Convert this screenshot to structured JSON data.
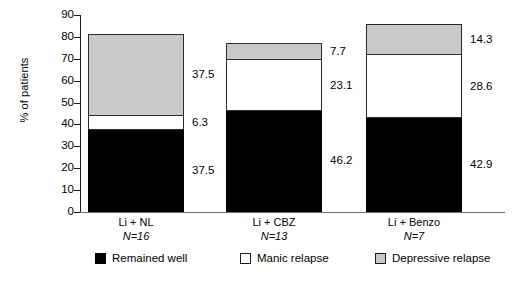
{
  "chart_data": {
    "type": "bar",
    "subtype": "stacked-bar",
    "title": "",
    "xlabel": "",
    "ylabel": "% of patients",
    "ylim": [
      0,
      90
    ],
    "ytick_step": 10,
    "yticks": [
      90,
      80,
      70,
      60,
      50,
      40,
      30,
      20,
      10,
      0
    ],
    "grid": false,
    "legend_position": "bottom",
    "categories": [
      "Li + NL",
      "Li + CBZ",
      "Li + Benzo"
    ],
    "category_sublabels": [
      "N=16",
      "N=13",
      "N=7"
    ],
    "series": [
      {
        "name": "Remained well",
        "color": "#000000",
        "values": [
          37.5,
          46.2,
          42.9
        ],
        "value_labels": [
          "37.5",
          "46.2",
          "42.9"
        ]
      },
      {
        "name": "Manic relapse",
        "color": "#ffffff",
        "values": [
          6.3,
          23.1,
          28.6
        ],
        "value_labels": [
          "6.3",
          "23.1",
          "28.6"
        ]
      },
      {
        "name": "Depressive relapse",
        "color": "#c9c9c9",
        "values": [
          37.5,
          7.7,
          14.3
        ],
        "value_labels": [
          "37.5",
          "7.7",
          "14.3"
        ]
      }
    ],
    "totals": [
      81.3,
      77.0,
      85.8
    ]
  },
  "axis": {
    "y_title": "% of patients",
    "y_tick_labels": [
      "90",
      "80",
      "70",
      "60",
      "50",
      "40",
      "30",
      "20",
      "10",
      "0"
    ]
  },
  "legend": {
    "items": [
      {
        "label": "Remained well",
        "swatch": "black"
      },
      {
        "label": "Manic relapse",
        "swatch": "white"
      },
      {
        "label": "Depressive relapse",
        "swatch": "gray"
      }
    ]
  },
  "groups": [
    {
      "name": "Li + NL",
      "n_label": "N=16",
      "segments": [
        {
          "series": "Depressive relapse",
          "value": 37.5,
          "label": "37.5"
        },
        {
          "series": "Manic relapse",
          "value": 6.3,
          "label": "6.3"
        },
        {
          "series": "Remained well",
          "value": 37.5,
          "label": "37.5"
        }
      ]
    },
    {
      "name": "Li + CBZ",
      "n_label": "N=13",
      "segments": [
        {
          "series": "Depressive relapse",
          "value": 7.7,
          "label": "7.7"
        },
        {
          "series": "Manic relapse",
          "value": 23.1,
          "label": "23.1"
        },
        {
          "series": "Remained well",
          "value": 46.2,
          "label": "46.2"
        }
      ]
    },
    {
      "name": "Li + Benzo",
      "n_label": "N=7",
      "segments": [
        {
          "series": "Depressive relapse",
          "value": 14.3,
          "label": "14.3"
        },
        {
          "series": "Manic relapse",
          "value": 28.6,
          "label": "28.6"
        },
        {
          "series": "Remained well",
          "value": 42.9,
          "label": "42.9"
        }
      ]
    }
  ],
  "colors": {
    "remained_well": "#000000",
    "manic_relapse": "#ffffff",
    "depressive_relapse": "#c9c9c9",
    "axis": "#1b1b1b"
  }
}
